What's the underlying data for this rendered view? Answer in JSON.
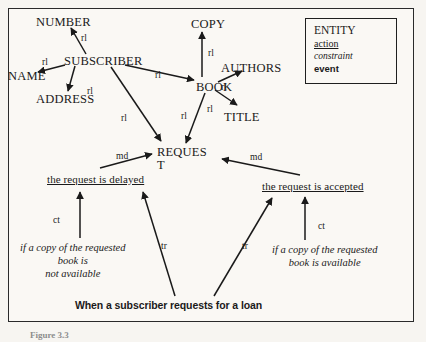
{
  "figure": {
    "background_color": "#faf8f4",
    "ink_color": "#1a1a1a",
    "caption": "Figure 3.3"
  },
  "legend": {
    "title": "Legend",
    "rows": [
      {
        "label": "ENTITY",
        "style": "entity"
      },
      {
        "label": "action",
        "style": "action"
      },
      {
        "label": "constraint",
        "style": "constraint"
      },
      {
        "label": "event",
        "style": "event"
      }
    ]
  },
  "chart_data": {
    "type": "diagram",
    "nodes": [
      {
        "id": "number",
        "label": "NUMBER",
        "style": "entity",
        "x": 36,
        "y": 16
      },
      {
        "id": "subscriber",
        "label": "SUBSCRIBER",
        "style": "entity",
        "x": 64,
        "y": 55
      },
      {
        "id": "name",
        "label": "NAME",
        "style": "entity",
        "x": 8,
        "y": 70
      },
      {
        "id": "address",
        "label": "ADDRESS",
        "style": "entity",
        "x": 36,
        "y": 93
      },
      {
        "id": "copy",
        "label": "COPY",
        "style": "entity",
        "x": 191,
        "y": 18
      },
      {
        "id": "book",
        "label": "BOOK",
        "style": "entity",
        "x": 196,
        "y": 81
      },
      {
        "id": "authors",
        "label": "AUTHORS",
        "style": "entity",
        "x": 221,
        "y": 62
      },
      {
        "id": "title",
        "label": "TITLE",
        "style": "entity",
        "x": 224,
        "y": 111
      },
      {
        "id": "request",
        "label": "REQUES\nT",
        "style": "entity",
        "x": 157,
        "y": 146
      },
      {
        "id": "delayed",
        "label": "the request is delayed",
        "style": "action",
        "x": 47,
        "y": 174
      },
      {
        "id": "accepted",
        "label": "the request is accepted",
        "style": "action",
        "x": 262,
        "y": 181
      },
      {
        "id": "c_not_avail",
        "label": "if a copy of the requested\nbook is\nnot available",
        "style": "constraint",
        "x": 20,
        "y": 241
      },
      {
        "id": "c_avail",
        "label": "if a copy of the requested\nbook is available",
        "style": "constraint",
        "x": 272,
        "y": 243
      },
      {
        "id": "loan_event",
        "label": "When a subscriber requests for a loan",
        "style": "event",
        "x": 75,
        "y": 300
      }
    ],
    "edges": [
      {
        "from": "subscriber",
        "to": "number",
        "label": "rl",
        "label_x": 81,
        "label_y": 33,
        "x1": 86,
        "y1": 54,
        "x2": 71,
        "y2": 28
      },
      {
        "from": "subscriber",
        "to": "name",
        "label": "rl",
        "label_x": 42,
        "label_y": 57,
        "x1": 65,
        "y1": 65,
        "x2": 38,
        "y2": 72
      },
      {
        "from": "subscriber",
        "to": "address",
        "label": "rl",
        "label_x": 87,
        "label_y": 86,
        "x1": 75,
        "y1": 66,
        "x2": 68,
        "y2": 91
      },
      {
        "from": "subscriber",
        "to": "book",
        "label": "rl",
        "label_x": 155,
        "label_y": 70,
        "x1": 125,
        "y1": 65,
        "x2": 194,
        "y2": 80
      },
      {
        "from": "subscriber",
        "to": "request",
        "label": "rl",
        "label_x": 121,
        "label_y": 113,
        "x1": 111,
        "y1": 67,
        "x2": 161,
        "y2": 141
      },
      {
        "from": "book",
        "to": "copy",
        "label": "rl",
        "label_x": 208,
        "label_y": 48,
        "x1": 202,
        "y1": 77,
        "x2": 202,
        "y2": 32
      },
      {
        "from": "book",
        "to": "authors",
        "label": "rl",
        "label_x": 221,
        "label_y": 82,
        "x1": 218,
        "y1": 82,
        "x2": 242,
        "y2": 71
      },
      {
        "from": "book",
        "to": "title",
        "label": "rl",
        "label_x": 207,
        "label_y": 104,
        "x1": 215,
        "y1": 90,
        "x2": 237,
        "y2": 105
      },
      {
        "from": "book",
        "to": "request",
        "label": "rl",
        "label_x": 181,
        "label_y": 111,
        "x1": 205,
        "y1": 93,
        "x2": 186,
        "y2": 143
      },
      {
        "from": "delayed",
        "to": "request",
        "label": "md",
        "label_x": 116,
        "label_y": 151,
        "x1": 100,
        "y1": 168,
        "x2": 152,
        "y2": 154
      },
      {
        "from": "accepted",
        "to": "request",
        "label": "md",
        "label_x": 250,
        "label_y": 152,
        "x1": 300,
        "y1": 175,
        "x2": 222,
        "y2": 159
      },
      {
        "from": "c_not_avail",
        "to": "delayed",
        "label": "ct",
        "label_x": 53,
        "label_y": 215,
        "x1": 80,
        "y1": 238,
        "x2": 80,
        "y2": 192
      },
      {
        "from": "c_avail",
        "to": "accepted",
        "label": "ct",
        "label_x": 318,
        "label_y": 221,
        "x1": 305,
        "y1": 240,
        "x2": 305,
        "y2": 197
      },
      {
        "from": "loan_event",
        "to": "delayed",
        "label": "tr",
        "label_x": 161,
        "label_y": 241,
        "x1": 175,
        "y1": 296,
        "x2": 143,
        "y2": 192
      },
      {
        "from": "loan_event",
        "to": "accepted",
        "label": "tr",
        "label_x": 242,
        "label_y": 241,
        "x1": 214,
        "y1": 296,
        "x2": 272,
        "y2": 198
      }
    ]
  }
}
